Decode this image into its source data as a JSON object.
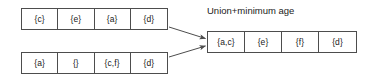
{
  "diagram": {
    "type": "array-union-merge",
    "background_color": "#ffffff",
    "line_color": "#4d4d4d",
    "text_color": "#1a1a1a",
    "inputs": [
      {
        "name": "top-input-array",
        "cells": [
          "{c}",
          "{e}",
          "{a}",
          "{d}"
        ]
      },
      {
        "name": "bottom-input-array",
        "cells": [
          "{a}",
          "{}",
          "{c,f}",
          "{d}"
        ]
      }
    ],
    "operation_label": "Union+minimum age",
    "result": {
      "name": "result-array",
      "cells": [
        "{a,c}",
        "{e}",
        "{f}",
        "{d}"
      ]
    },
    "arrows": [
      {
        "name": "arrow-top-to-result",
        "from": "top-input-array",
        "to": "result-array"
      },
      {
        "name": "arrow-bottom-to-result",
        "from": "bottom-input-array",
        "to": "result-array"
      }
    ]
  }
}
